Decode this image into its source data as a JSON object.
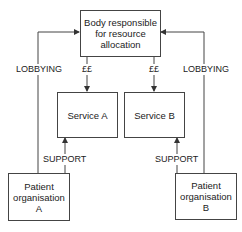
{
  "diagram": {
    "nodes": {
      "body": {
        "label": "Body responsible\nfor resource\nallocation"
      },
      "service_a": {
        "label": "Service A"
      },
      "service_b": {
        "label": "Service B"
      },
      "patient_a": {
        "label": "Patient\norganisation\nA"
      },
      "patient_b": {
        "label": "Patient\norganisation\nB"
      }
    },
    "edges": [
      {
        "from": "patient_a",
        "to": "body",
        "label": "LOBBYING"
      },
      {
        "from": "patient_b",
        "to": "body",
        "label": "LOBBYING"
      },
      {
        "from": "body",
        "to": "service_a",
        "label": "££"
      },
      {
        "from": "body",
        "to": "service_b",
        "label": "££"
      },
      {
        "from": "patient_a",
        "to": "service_a",
        "label": "SUPPORT"
      },
      {
        "from": "patient_b",
        "to": "service_b",
        "label": "SUPPORT"
      }
    ]
  }
}
